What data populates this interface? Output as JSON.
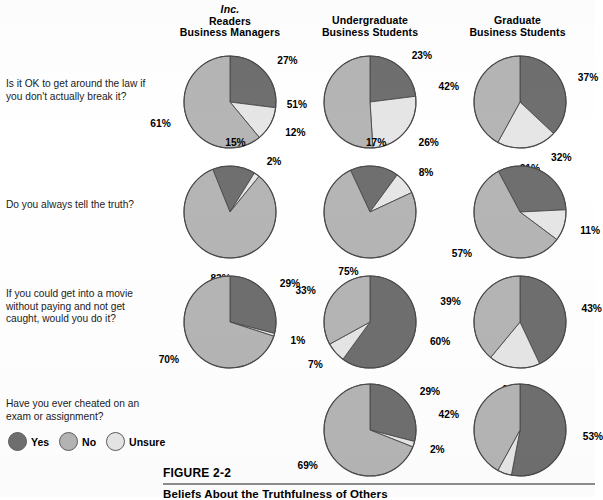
{
  "figure": {
    "number": "FIGURE 2-2",
    "title": "Beliefs About the Truthfulness of Others"
  },
  "columns": [
    {
      "id": "inc-readers",
      "italic_line": "Inc.",
      "line1": "Readers",
      "line2": "Business Managers"
    },
    {
      "id": "undergraduate",
      "italic_line": "",
      "line1": "Undergraduate",
      "line2": "Business Students"
    },
    {
      "id": "graduate",
      "italic_line": "",
      "line1": "Graduate",
      "line2": "Business Students"
    }
  ],
  "legend": {
    "items": [
      {
        "label": "Yes",
        "color": "#6f6f6f"
      },
      {
        "label": "No",
        "color": "#b5b5b5"
      },
      {
        "label": "Unsure",
        "color": "#e6e6e6"
      }
    ]
  },
  "colors": {
    "yes": "#6f6f6f",
    "no": "#b5b5b5",
    "unsure": "#e6e6e6",
    "outline": "#4a4a4a",
    "rule": "#8d8d8d"
  },
  "questions": [
    "Is it OK to get around the law if you don't actually break it?",
    "Do you always tell the truth?",
    "If you could get into a movie without paying and not get caught, would you do it?",
    "Have you ever cheated on an exam or assignment?"
  ],
  "chart_data": {
    "type": "pie",
    "title": "Beliefs About the Truthfulness of Others",
    "legend_position": "bottom-left",
    "categories": [
      "Yes",
      "No",
      "Unsure"
    ],
    "units": "percent",
    "groups": [
      "Inc. Readers Business Managers",
      "Undergraduate Business Students",
      "Graduate Business Students"
    ],
    "charts": [
      {
        "question": "Is it OK to get around the law if you don't actually break it?",
        "group": "Inc. Readers Business Managers",
        "row": 0,
        "col": 0,
        "start_angle": 0,
        "slices": [
          {
            "name": "Yes",
            "value": 27,
            "label": "27%"
          },
          {
            "name": "Unsure",
            "value": 12,
            "label": "12%"
          },
          {
            "name": "No",
            "value": 61,
            "label": "61%"
          }
        ]
      },
      {
        "question": "Is it OK to get around the law if you don't actually break it?",
        "group": "Undergraduate Business Students",
        "row": 0,
        "col": 1,
        "start_angle": 0,
        "slices": [
          {
            "name": "Yes",
            "value": 23,
            "label": "23%"
          },
          {
            "name": "Unsure",
            "value": 26,
            "label": "26%"
          },
          {
            "name": "No",
            "value": 51,
            "label": "51%"
          }
        ]
      },
      {
        "question": "Is it OK to get around the law if you don't actually break it?",
        "group": "Graduate Business Students",
        "row": 0,
        "col": 2,
        "start_angle": 0,
        "slices": [
          {
            "name": "Yes",
            "value": 37,
            "label": "37%"
          },
          {
            "name": "Unsure",
            "value": 21,
            "label": "21%"
          },
          {
            "name": "No",
            "value": 42,
            "label": "42%"
          }
        ]
      },
      {
        "question": "Do you always tell the truth?",
        "group": "Inc. Readers Business Managers",
        "row": 1,
        "col": 0,
        "start_angle": -22,
        "slices": [
          {
            "name": "Yes",
            "value": 15,
            "label": "15%"
          },
          {
            "name": "Unsure",
            "value": 2,
            "label": "2%"
          },
          {
            "name": "No",
            "value": 83,
            "label": "83%"
          }
        ]
      },
      {
        "question": "Do you always tell the truth?",
        "group": "Undergraduate Business Students",
        "row": 1,
        "col": 1,
        "start_angle": -25,
        "slices": [
          {
            "name": "Yes",
            "value": 17,
            "label": "17%"
          },
          {
            "name": "Unsure",
            "value": 8,
            "label": "8%"
          },
          {
            "name": "No",
            "value": 75,
            "label": "75%"
          }
        ]
      },
      {
        "question": "Do you always tell the truth?",
        "group": "Graduate Business Students",
        "row": 1,
        "col": 2,
        "start_angle": -28,
        "slices": [
          {
            "name": "Yes",
            "value": 32,
            "label": "32%"
          },
          {
            "name": "Unsure",
            "value": 11,
            "label": "11%"
          },
          {
            "name": "No",
            "value": 57,
            "label": "57%"
          }
        ]
      },
      {
        "question": "If you could get into a movie without paying and not get caught, would you do it?",
        "group": "Inc. Readers Business Managers",
        "row": 2,
        "col": 0,
        "start_angle": 0,
        "slices": [
          {
            "name": "Yes",
            "value": 29,
            "label": "29%"
          },
          {
            "name": "Unsure",
            "value": 1,
            "label": "1%"
          },
          {
            "name": "No",
            "value": 70,
            "label": "70%"
          }
        ]
      },
      {
        "question": "If you could get into a movie without paying and not get caught, would you do it?",
        "group": "Undergraduate Business Students",
        "row": 2,
        "col": 1,
        "start_angle": 0,
        "slices": [
          {
            "name": "Yes",
            "value": 60,
            "label": "60%"
          },
          {
            "name": "Unsure",
            "value": 7,
            "label": "7%"
          },
          {
            "name": "No",
            "value": 33,
            "label": "33%"
          }
        ]
      },
      {
        "question": "If you could get into a movie without paying and not get caught, would you do it?",
        "group": "Graduate Business Students",
        "row": 2,
        "col": 2,
        "start_angle": 0,
        "slices": [
          {
            "name": "Yes",
            "value": 43,
            "label": "43%"
          },
          {
            "name": "Unsure",
            "value": 18,
            "label": "18%"
          },
          {
            "name": "No",
            "value": 39,
            "label": "39%"
          }
        ]
      },
      {
        "question": "Have you ever cheated on an exam or assignment?",
        "group": "Undergraduate Business Students",
        "row": 3,
        "col": 1,
        "start_angle": 0,
        "slices": [
          {
            "name": "Yes",
            "value": 29,
            "label": "29%"
          },
          {
            "name": "Unsure",
            "value": 2,
            "label": "2%"
          },
          {
            "name": "No",
            "value": 69,
            "label": "69%"
          }
        ]
      },
      {
        "question": "Have you ever cheated on an exam or assignment?",
        "group": "Graduate Business Students",
        "row": 3,
        "col": 2,
        "start_angle": 0,
        "slices": [
          {
            "name": "Yes",
            "value": 53,
            "label": "53%"
          },
          {
            "name": "Unsure",
            "value": 5,
            "label": ""
          },
          {
            "name": "No",
            "value": 42,
            "label": "42%"
          }
        ]
      }
    ]
  },
  "layout": {
    "col_x": [
      150,
      290,
      440
    ],
    "row_y": [
      46,
      156,
      266,
      374
    ],
    "row_q_y": [
      78,
      196,
      288,
      396
    ],
    "radius": 46
  }
}
